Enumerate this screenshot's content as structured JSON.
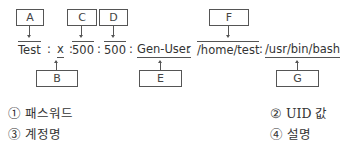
{
  "diagram": {
    "tokens": [
      {
        "text": "Test",
        "mark": "over",
        "label": "A"
      },
      {
        "text": ":"
      },
      {
        "text": "x",
        "mark": "under",
        "label": "B"
      },
      {
        "text": ":"
      },
      {
        "text": "500",
        "mark": "over",
        "label": "C"
      },
      {
        "text": ":"
      },
      {
        "text": "500",
        "mark": "over",
        "label": "D"
      },
      {
        "text": ":"
      },
      {
        "text": "Gen-User",
        "mark": "under",
        "label": "E"
      },
      {
        "text": ":"
      },
      {
        "text": "/home/test",
        "mark": "over",
        "label": "F"
      },
      {
        "text": ":"
      },
      {
        "text": "/usr/bin/bash",
        "mark": "under",
        "label": "G"
      }
    ],
    "labels": {
      "A": "A",
      "B": "B",
      "C": "C",
      "D": "D",
      "E": "E",
      "F": "F",
      "G": "G"
    }
  },
  "options": [
    {
      "number": "①",
      "text": "패스워드"
    },
    {
      "number": "②",
      "text": "UID 값"
    },
    {
      "number": "③",
      "text": "계정명"
    },
    {
      "number": "④",
      "text": "설명"
    }
  ]
}
